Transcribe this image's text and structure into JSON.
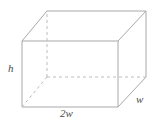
{
  "figure": {
    "name": "rectangular-prism-diagram",
    "shape": "rectangular prism",
    "stroke_color": "#a8a8a8",
    "hidden_stroke_color": "#bcbcbc",
    "background_color": "#ffffff",
    "label_color": "#4a4a4a",
    "labels": {
      "height": "h",
      "width": "2w",
      "depth": "w"
    },
    "geometry": {
      "front_face": [
        [
          22,
          41
        ],
        [
          118,
          41
        ],
        [
          118,
          107
        ],
        [
          22,
          107
        ]
      ],
      "back_face": [
        [
          47,
          11
        ],
        [
          146,
          11
        ],
        [
          146,
          77
        ],
        [
          47,
          77
        ]
      ],
      "hidden_vertex": [
        47,
        77
      ],
      "hidden_edges": [
        [
          [
            47,
            77
          ],
          [
            47,
            11
          ]
        ],
        [
          [
            47,
            77
          ],
          [
            146,
            77
          ]
        ],
        [
          [
            47,
            77
          ],
          [
            22,
            107
          ]
        ]
      ]
    }
  }
}
